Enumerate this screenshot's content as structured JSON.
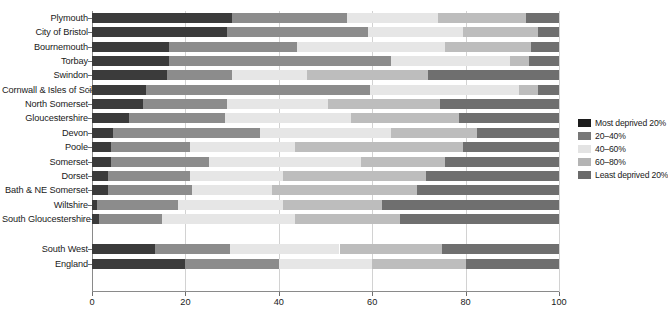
{
  "chart_data": {
    "type": "bar",
    "subtype": "stacked-horizontal-100pct",
    "title": "",
    "xlabel": "",
    "ylabel": "",
    "xlim": [
      0,
      100
    ],
    "xticks": [
      0,
      20,
      40,
      60,
      80,
      100
    ],
    "grid": true,
    "grid_axis": "x",
    "legend_position": "right",
    "stack_total": 100,
    "legend": [
      {
        "label": "Most deprived 20%",
        "color": "#1c1c1c"
      },
      {
        "label": "20–40%",
        "color": "#787878"
      },
      {
        "label": "40–60%",
        "color": "#e3e3e3"
      },
      {
        "label": "60–80%",
        "color": "#b4b4b4"
      },
      {
        "label": "Least deprived 20%",
        "color": "#6b6b6b"
      }
    ],
    "series": [
      {
        "name": "Most deprived 20%",
        "color": "#3b3b3b"
      },
      {
        "name": "20–40%",
        "color": "#8c8c8c"
      },
      {
        "name": "40–60%",
        "color": "#e6e6e6"
      },
      {
        "name": "60–80%",
        "color": "#bdbdbd"
      },
      {
        "name": "Least deprived 20%",
        "color": "#6f6f6f"
      }
    ],
    "categories": [
      "Plymouth",
      "City of Bristol",
      "Bournemouth",
      "Torbay",
      "Swindon",
      "Cornwall & Isles of Scilly",
      "North Somerset",
      "Gloucestershire",
      "Devon",
      "Poole",
      "Somerset",
      "Dorset",
      "Bath & NE Somerset",
      "Wiltshire",
      "South Gloucestershire",
      "",
      "South West",
      "England"
    ],
    "rows": [
      {
        "category": "Plymouth",
        "values": [
          30.0,
          24.5,
          19.5,
          19.0,
          7.0
        ]
      },
      {
        "category": "City of Bristol",
        "values": [
          29.0,
          30.0,
          20.5,
          16.0,
          4.5
        ]
      },
      {
        "category": "Bournemouth",
        "values": [
          16.5,
          27.5,
          31.5,
          18.5,
          6.0
        ]
      },
      {
        "category": "Torbay",
        "values": [
          16.5,
          47.5,
          25.5,
          4.0,
          6.5
        ]
      },
      {
        "category": "Swindon",
        "values": [
          16.0,
          14.0,
          16.0,
          26.0,
          28.0
        ]
      },
      {
        "category": "Cornwall & Isles of Scilly",
        "values": [
          11.5,
          48.0,
          32.0,
          4.0,
          4.5
        ]
      },
      {
        "category": "North Somerset",
        "values": [
          11.0,
          18.0,
          21.5,
          24.0,
          25.5
        ]
      },
      {
        "category": "Gloucestershire",
        "values": [
          8.0,
          20.5,
          27.0,
          23.0,
          21.5
        ]
      },
      {
        "category": "Devon",
        "values": [
          4.5,
          31.5,
          28.0,
          18.5,
          17.5
        ]
      },
      {
        "category": "Poole",
        "values": [
          4.0,
          17.0,
          22.5,
          36.0,
          20.5
        ]
      },
      {
        "category": "Somerset",
        "values": [
          4.0,
          21.0,
          32.5,
          18.0,
          24.5
        ]
      },
      {
        "category": "Dorset",
        "values": [
          3.5,
          17.5,
          20.0,
          30.5,
          28.5
        ]
      },
      {
        "category": "Bath & NE Somerset",
        "values": [
          3.5,
          18.0,
          17.0,
          31.0,
          30.5
        ]
      },
      {
        "category": "Wiltshire",
        "values": [
          1.0,
          17.5,
          22.5,
          21.0,
          38.0
        ]
      },
      {
        "category": "South Gloucestershire",
        "values": [
          1.5,
          13.5,
          28.5,
          22.5,
          34.0
        ]
      },
      {
        "category": "South West",
        "values": [
          13.5,
          16.0,
          23.5,
          22.0,
          25.0
        ]
      },
      {
        "category": "England",
        "values": [
          20.0,
          20.0,
          20.0,
          20.0,
          20.0
        ]
      }
    ]
  }
}
